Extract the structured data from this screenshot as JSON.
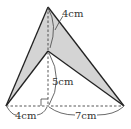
{
  "diagram": {
    "labels": {
      "top_length": "4cm",
      "height_length": "5cm",
      "left_base": "4cm",
      "right_base": "7cm"
    },
    "colors": {
      "shade": "#d4d4d4",
      "line": "#222222"
    }
  }
}
